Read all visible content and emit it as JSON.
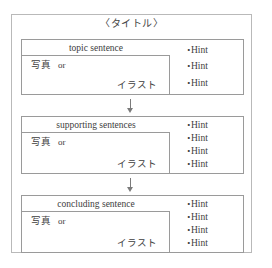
{
  "diagram": {
    "title": "〈タイトル〉",
    "media": {
      "photo_label": "写真",
      "or_label": "or",
      "illustration_label": "イラスト"
    },
    "arrow_glyph": "↓",
    "hint_bullet": "・",
    "blocks": [
      {
        "sentence": "topic sentence",
        "hints": [
          "Hint",
          "Hint",
          "Hint"
        ]
      },
      {
        "sentence": "supporting sentences",
        "hints": [
          "Hint",
          "Hint",
          "Hint",
          "Hint"
        ]
      },
      {
        "sentence": "concluding sentence",
        "hints": [
          "Hint",
          "Hint",
          "Hint",
          "Hint"
        ]
      }
    ]
  },
  "colors": {
    "frame_border": "#b9b9b9",
    "box_border": "#9a9a9a",
    "text": "#3d3d3d",
    "arrow": "#7b7b7b",
    "background": "#ffffff"
  }
}
